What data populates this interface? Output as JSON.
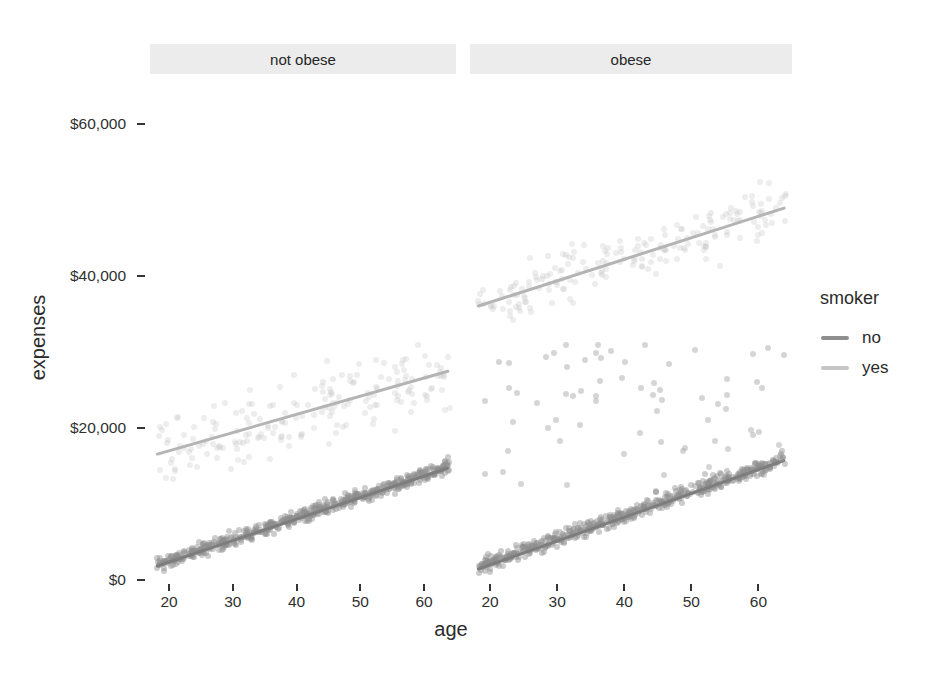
{
  "chart_data": {
    "type": "scatter",
    "title": "",
    "xlabel": "age",
    "ylabel": "expenses",
    "xlim": [
      17,
      65
    ],
    "ylim": [
      0,
      66000
    ],
    "xticks": [
      20,
      30,
      40,
      50,
      60
    ],
    "xtick_labels": [
      "20",
      "30",
      "40",
      "50",
      "60"
    ],
    "yticks": [
      0,
      20000,
      40000,
      60000
    ],
    "ytick_labels": [
      "$0",
      "$20,000",
      "$40,000",
      "$60,000"
    ],
    "grid": false,
    "facet_variable": "obesity",
    "facets": [
      {
        "label": "not obese",
        "series": [
          {
            "name": "no",
            "color": "#8f8f8f",
            "point_count": 560,
            "trend": {
              "x0": 18,
              "y0": 1800,
              "x1": 64,
              "y1": 14800
            },
            "band_halfwidth": 1800
          },
          {
            "name": "yes",
            "color": "#c2c2c2",
            "point_count": 190,
            "trend": {
              "x0": 18,
              "y0": 16500,
              "x1": 64,
              "y1": 27500
            },
            "band_halfwidth": 5200
          }
        ]
      },
      {
        "label": "obese",
        "series": [
          {
            "name": "no",
            "color": "#8f8f8f",
            "point_count": 560,
            "trend": {
              "x0": 18,
              "y0": 1400,
              "x1": 64,
              "y1": 15800
            },
            "band_halfwidth": 1900
          },
          {
            "name": "yes",
            "color": "#c2c2c2",
            "point_count": 190,
            "trend": {
              "x0": 18,
              "y0": 36000,
              "x1": 64,
              "y1": 49000
            },
            "band_halfwidth": 3600
          }
        ],
        "outlier_cloud": {
          "name": "no-high-cost-outliers",
          "color": "#9a9a9a",
          "point_count": 70,
          "y_range": [
            11500,
            31000
          ],
          "x_range": [
            18,
            64
          ]
        }
      }
    ]
  },
  "legend": {
    "title": "smoker",
    "position": "right",
    "items": [
      {
        "label": "no",
        "color": "#8f8f8f"
      },
      {
        "label": "yes",
        "color": "#c6c6c6"
      }
    ]
  },
  "theme": {
    "panel_background": "#ffffff",
    "strip_background": "#ececec",
    "text_color": "#2b2b2b",
    "axis_color": "#353535"
  }
}
